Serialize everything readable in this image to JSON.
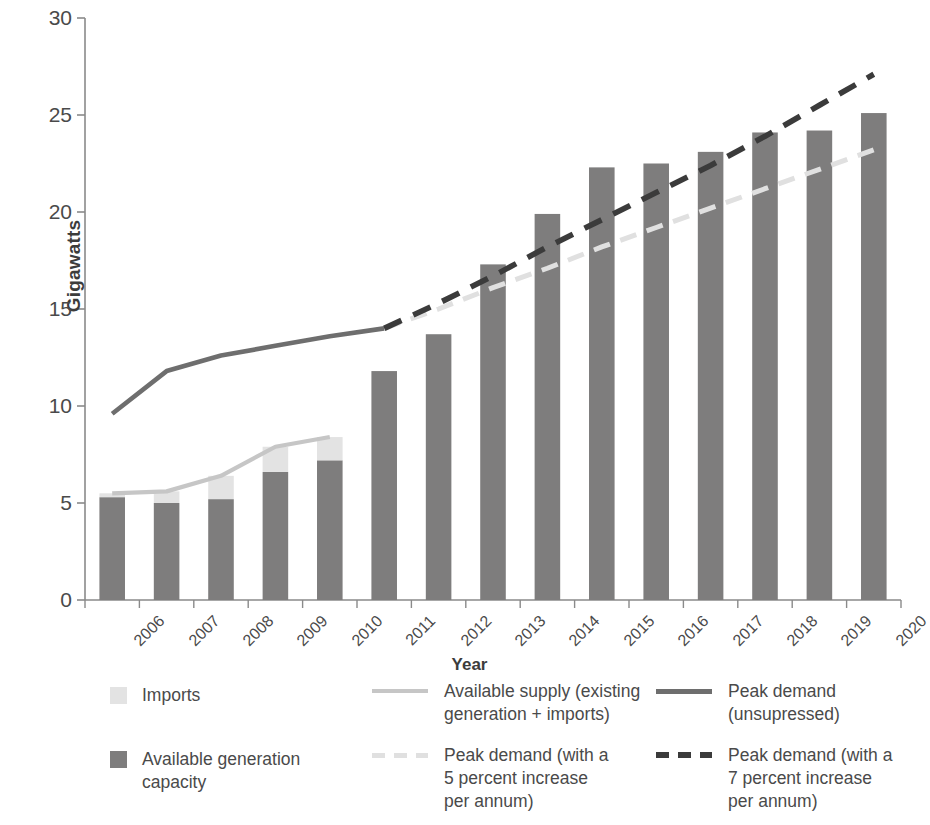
{
  "chart_data": {
    "type": "bar",
    "title": "",
    "xlabel": "Year",
    "ylabel": "Gigawatts",
    "ylim": [
      0,
      30
    ],
    "yticks": [
      0,
      5,
      10,
      15,
      20,
      25,
      30
    ],
    "grid": false,
    "legend_position": "bottom",
    "categories": [
      "2006",
      "2007",
      "2008",
      "2009",
      "2010",
      "2011",
      "2012",
      "2013",
      "2014",
      "2015",
      "2016",
      "2017",
      "2018",
      "2019",
      "2020"
    ],
    "series": [
      {
        "name": "Available generation capacity",
        "type": "bar",
        "color": "#7e7d7d",
        "values": [
          5.3,
          5.0,
          5.2,
          6.6,
          7.2,
          11.8,
          13.7,
          17.3,
          19.9,
          22.3,
          22.5,
          23.1,
          24.1,
          24.2,
          25.1
        ]
      },
      {
        "name": "Imports",
        "type": "bar-stacked-top",
        "color": "#e3e3e3",
        "values": [
          0.2,
          0.6,
          1.2,
          1.3,
          1.2,
          null,
          null,
          null,
          null,
          null,
          null,
          null,
          null,
          null,
          null
        ]
      },
      {
        "name": "Available supply (existing generation + imports)",
        "type": "line",
        "style": "solid",
        "color": "#c6c6c6",
        "values": [
          5.5,
          5.6,
          6.4,
          7.9,
          8.4,
          null,
          null,
          null,
          null,
          null,
          null,
          null,
          null,
          null,
          null
        ]
      },
      {
        "name": "Peak demand (unsupressed)",
        "type": "line",
        "style": "solid",
        "color": "#6e6e6e",
        "values": [
          9.6,
          11.8,
          12.6,
          13.1,
          13.6,
          14.0,
          null,
          null,
          null,
          null,
          null,
          null,
          null,
          null,
          null
        ]
      },
      {
        "name": "Peak demand (with a 5 percent increase per annum)",
        "type": "line",
        "style": "dashed",
        "color": "#e0e0e0",
        "values": [
          null,
          null,
          null,
          null,
          null,
          14.0,
          15.0,
          16.1,
          17.1,
          18.2,
          19.2,
          20.2,
          21.2,
          22.2,
          23.2
        ]
      },
      {
        "name": "Peak demand (with a 7 percent increase per annum)",
        "type": "line",
        "style": "dashed",
        "color": "#3b3b3b",
        "values": [
          null,
          null,
          null,
          null,
          null,
          14.0,
          15.3,
          16.7,
          18.2,
          19.6,
          21.0,
          22.4,
          23.9,
          25.5,
          27.1
        ]
      }
    ]
  },
  "axis": {
    "ylabel": "Gigawatts",
    "xlabel": "Year",
    "yticks": [
      "30",
      "25",
      "20",
      "15",
      "10",
      "5",
      "0"
    ],
    "xticks": [
      "2006",
      "2007",
      "2008",
      "2009",
      "2010",
      "2011",
      "2012",
      "2013",
      "2014",
      "2015",
      "2016",
      "2017",
      "2018",
      "2019",
      "2020"
    ]
  },
  "legend": {
    "items": [
      {
        "id": "imports",
        "marker": "swatch-light",
        "label": "Imports"
      },
      {
        "id": "gen-capacity",
        "marker": "swatch-dark",
        "label": "Available generation\ncapacity"
      },
      {
        "id": "available-supply",
        "marker": "line-light-solid",
        "label": "Available supply (existing\ngeneration + imports)"
      },
      {
        "id": "peak-5pct",
        "marker": "line-light-dashed",
        "label": "Peak demand (with a\n5 percent increase\nper annum)"
      },
      {
        "id": "peak-unsupressed",
        "marker": "line-dark-solid",
        "label": "Peak demand\n(unsupressed)"
      },
      {
        "id": "peak-7pct",
        "marker": "line-dark-dashed",
        "label": "Peak demand (with a\n7 percent increase\nper annum)"
      }
    ]
  },
  "colors": {
    "bar_generation": "#7e7d7d",
    "bar_imports": "#e3e3e3",
    "line_supply": "#c6c6c6",
    "line_peak": "#6e6e6e",
    "line_5pct": "#e0e0e0",
    "line_7pct": "#3b3b3b",
    "axis": "#8a8a8a",
    "text": "#4a4a4a"
  }
}
